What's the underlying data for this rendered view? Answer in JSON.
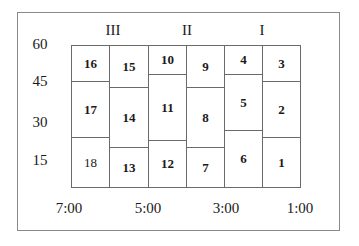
{
  "zones": [
    {
      "label": "III",
      "x": 113,
      "y": 30
    },
    {
      "label": "II",
      "x": 187,
      "y": 30
    },
    {
      "label": "I",
      "x": 262,
      "y": 30
    }
  ],
  "y_axis": [
    {
      "label": "60",
      "x": 40,
      "y": 44
    },
    {
      "label": "45",
      "x": 40,
      "y": 81
    },
    {
      "label": "30",
      "x": 40,
      "y": 122
    },
    {
      "label": "15",
      "x": 40,
      "y": 160
    }
  ],
  "x_axis": [
    {
      "label": "7:00",
      "x": 69,
      "y": 208
    },
    {
      "label": "5:00",
      "x": 148,
      "y": 208
    },
    {
      "label": "3:00",
      "x": 226,
      "y": 208
    },
    {
      "label": "1:00",
      "x": 300,
      "y": 208
    }
  ],
  "blocks": [
    {
      "id": "16",
      "col": 0,
      "top": 0,
      "bottom": 36,
      "bold": true
    },
    {
      "id": "17",
      "col": 0,
      "top": 36,
      "bottom": 92,
      "bold": true
    },
    {
      "id": "18",
      "col": 0,
      "top": 92,
      "bottom": 142,
      "bold": false
    },
    {
      "id": "15",
      "col": 1,
      "top": 0,
      "bottom": 42,
      "bold": true
    },
    {
      "id": "14",
      "col": 1,
      "top": 42,
      "bottom": 102,
      "bold": true
    },
    {
      "id": "13",
      "col": 1,
      "top": 102,
      "bottom": 142,
      "bold": true
    },
    {
      "id": "10",
      "col": 2,
      "top": 0,
      "bottom": 29,
      "bold": true
    },
    {
      "id": "11",
      "col": 2,
      "top": 29,
      "bottom": 95,
      "bold": true
    },
    {
      "id": "12",
      "col": 2,
      "top": 95,
      "bottom": 142,
      "bold": true
    },
    {
      "id": "9",
      "col": 3,
      "top": 0,
      "bottom": 42,
      "bold": true
    },
    {
      "id": "8",
      "col": 3,
      "top": 42,
      "bottom": 102,
      "bold": true
    },
    {
      "id": "7",
      "col": 3,
      "top": 102,
      "bottom": 142,
      "bold": true
    },
    {
      "id": "4",
      "col": 4,
      "top": 0,
      "bottom": 29,
      "bold": true
    },
    {
      "id": "5",
      "col": 4,
      "top": 29,
      "bottom": 85,
      "bold": true
    },
    {
      "id": "6",
      "col": 4,
      "top": 85,
      "bottom": 142,
      "bold": true
    },
    {
      "id": "3",
      "col": 5,
      "top": 0,
      "bottom": 36,
      "bold": true
    },
    {
      "id": "2",
      "col": 5,
      "top": 36,
      "bottom": 92,
      "bold": true
    },
    {
      "id": "1",
      "col": 5,
      "top": 92,
      "bottom": 142,
      "bold": true
    }
  ],
  "col_edges": [
    0,
    38,
    77,
    115,
    153,
    191,
    229
  ]
}
